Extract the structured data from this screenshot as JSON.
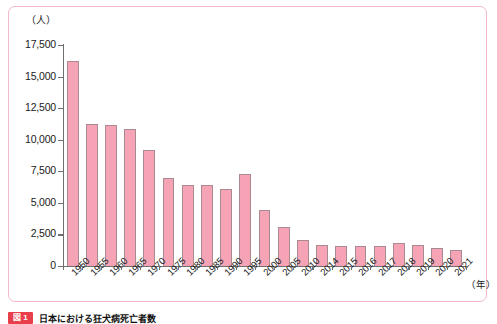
{
  "chart_data": {
    "type": "bar",
    "title": "",
    "xlabel": "（年）",
    "ylabel": "（人）",
    "ylim": [
      0,
      17500
    ],
    "ytick_step": 2500,
    "yticks": [
      "17,500",
      "15,000",
      "12,500",
      "10,000",
      "7,500",
      "5,000",
      "2,500",
      "0"
    ],
    "grid": false,
    "legend": "none",
    "bar_fill_color": "#f6a3b6",
    "bar_border_color": "#a98a93",
    "frame_color": "#f2b9c6",
    "categories": [
      "1950",
      "1955",
      "1960",
      "1965",
      "1970",
      "1975",
      "1980",
      "1985",
      "1990",
      "1995",
      "2000",
      "2005",
      "2010",
      "2014",
      "2015",
      "2016",
      "2017",
      "2018",
      "2019",
      "2020",
      "2021"
    ],
    "values": [
      16250,
      11250,
      11200,
      10850,
      9150,
      6950,
      6450,
      6400,
      6100,
      7250,
      4450,
      3050,
      2050,
      1650,
      1550,
      1550,
      1550,
      1800,
      1650,
      1400,
      1250
    ]
  },
  "yaxis": {
    "unit_label": "（人）",
    "ticks": [
      {
        "label": "17,500",
        "value": 17500
      },
      {
        "label": "15,000",
        "value": 15000
      },
      {
        "label": "12,500",
        "value": 12500
      },
      {
        "label": "10,000",
        "value": 10000
      },
      {
        "label": "7,500",
        "value": 7500
      },
      {
        "label": "5,000",
        "value": 5000
      },
      {
        "label": "2,500",
        "value": 2500
      },
      {
        "label": "0",
        "value": 0
      }
    ]
  },
  "xaxis": {
    "unit_label": "（年）",
    "labels": [
      "1950",
      "1955",
      "1960",
      "1965",
      "1970",
      "1975",
      "1980",
      "1985",
      "1990",
      "1995",
      "2000",
      "2005",
      "2010",
      "2014",
      "2015",
      "2016",
      "2017",
      "2018",
      "2019",
      "2020",
      "2021"
    ]
  },
  "caption": {
    "badge": "図 1",
    "text": "日本における狂犬病死亡者数"
  }
}
